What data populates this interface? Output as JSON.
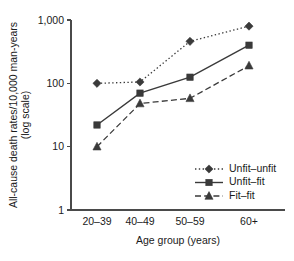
{
  "chart_data": {
    "type": "line",
    "title": "",
    "xlabel": "Age group (years)",
    "ylabel": "All-cause death rates/10,000 man-years (log scale)",
    "categories": [
      "20–39",
      "40–49",
      "50–59",
      "60+"
    ],
    "yscale": "log",
    "ylim": [
      1,
      1000
    ],
    "yticks": [
      1,
      10,
      100,
      1000
    ],
    "ytick_labels": [
      "1",
      "10",
      "100",
      "1,000"
    ],
    "grid": false,
    "legend_position": "lower right",
    "series": [
      {
        "name": "Unfit–unfit",
        "values": [
          100,
          105,
          460,
          800
        ],
        "line_style": "dotted",
        "marker": "diamond",
        "color": "#3a3a3a"
      },
      {
        "name": "Unfit–fit",
        "values": [
          22,
          70,
          125,
          400
        ],
        "line_style": "solid",
        "marker": "square",
        "color": "#3a3a3a"
      },
      {
        "name": "Fit–fit",
        "values": [
          10,
          48,
          58,
          190
        ],
        "line_style": "dashed",
        "marker": "triangle",
        "color": "#3a3a3a"
      }
    ]
  },
  "axis": {
    "y_label_line1": "All-cause death rates/10,000 man-years",
    "y_label_line2": "(log scale)",
    "x_title": "Age group (years)"
  },
  "colors": {
    "ink": "#1a1a1a",
    "axis": "#4a4a4a",
    "series": "#3a3a3a",
    "background": "#ffffff"
  }
}
